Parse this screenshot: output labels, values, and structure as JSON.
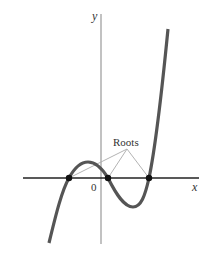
{
  "diagram": {
    "type": "cubic-function-graph",
    "axes": {
      "x_label": "x",
      "y_label": "y",
      "origin_label": "0"
    },
    "annotation": {
      "label": "Roots",
      "root_count": 3
    },
    "colors": {
      "curve": "#555555",
      "x_axis": "#222222",
      "y_axis": "#999999",
      "leader_lines": "#aaaaaa",
      "points": "#111111"
    }
  }
}
